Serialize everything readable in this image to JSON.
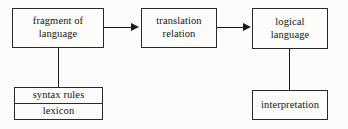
{
  "diagram": {
    "nodes": {
      "fragment": {
        "label": "fragment of\nlanguage"
      },
      "translation": {
        "label": "translation\nrelation"
      },
      "logical": {
        "label": "logical\nlanguage"
      },
      "syntax_rules": {
        "label": "syntax rules"
      },
      "lexicon": {
        "label": "lexicon"
      },
      "interpretation": {
        "label": "interpretation"
      }
    },
    "edges": [
      {
        "name": "fragment-to-translation",
        "kind": "arrow",
        "direction": "right"
      },
      {
        "name": "translation-to-logical",
        "kind": "arrow",
        "direction": "right"
      },
      {
        "name": "fragment-to-syntax-lexicon",
        "kind": "line",
        "direction": "down"
      },
      {
        "name": "logical-to-interpretation",
        "kind": "line",
        "direction": "down"
      }
    ],
    "colors": {
      "background": "#fbfbf9",
      "node_fill": "#fcfcfa",
      "stroke": "#2a2a2a",
      "connector": "#1b1b1b",
      "text": "#141414"
    }
  }
}
